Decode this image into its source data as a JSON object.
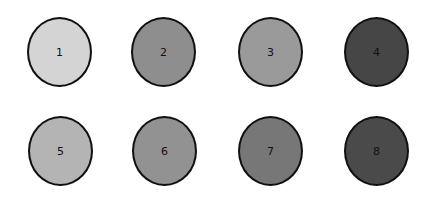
{
  "circles": [
    {
      "label": "1",
      "color": "#d4d4d4",
      "x": 27,
      "y": 17
    },
    {
      "label": "2",
      "color": "#8e8e8e",
      "x": 131,
      "y": 17
    },
    {
      "label": "3",
      "color": "#9a9a9a",
      "x": 238,
      "y": 17
    },
    {
      "label": "4",
      "color": "#464646",
      "x": 344,
      "y": 17
    },
    {
      "label": "5",
      "color": "#b4b4b4",
      "x": 28,
      "y": 116
    },
    {
      "label": "6",
      "color": "#929292",
      "x": 132,
      "y": 116
    },
    {
      "label": "7",
      "color": "#777777",
      "x": 238,
      "y": 116
    },
    {
      "label": "8",
      "color": "#4a4a4a",
      "x": 344,
      "y": 116
    }
  ]
}
